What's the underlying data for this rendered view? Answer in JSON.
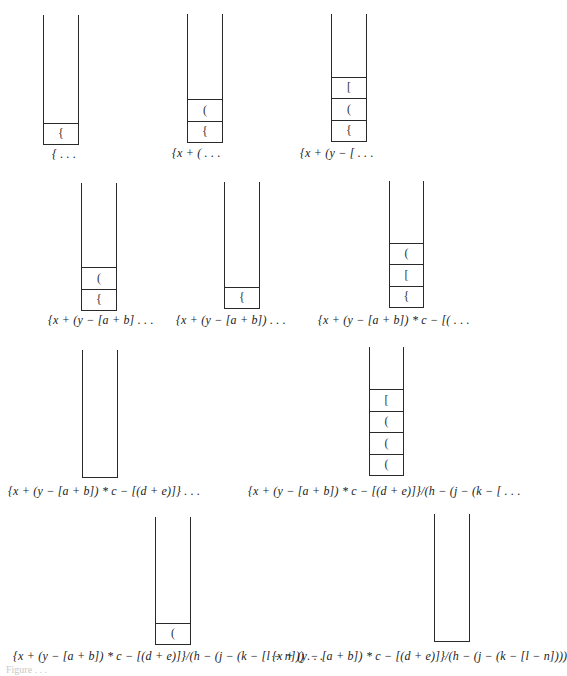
{
  "figure": {
    "stacks": [
      {
        "id": 1,
        "left": 43,
        "top": 15,
        "width": 36,
        "height": 130,
        "contents": [
          "{"
        ],
        "label": "{ . . .",
        "label_x": 52,
        "label_y": 147
      },
      {
        "id": 2,
        "left": 187,
        "top": 14,
        "width": 36,
        "height": 129,
        "contents": [
          "{",
          "("
        ],
        "label": "{x + ( . . .",
        "label_x": 172,
        "label_y": 146
      },
      {
        "id": 3,
        "left": 331,
        "top": 14,
        "width": 36,
        "height": 128,
        "contents": [
          "{",
          "(",
          "["
        ],
        "label": "{x + (y − [ . . .",
        "label_x": 300,
        "label_y": 146
      },
      {
        "id": 4,
        "left": 81,
        "top": 183,
        "width": 36,
        "height": 128,
        "contents": [
          "{",
          "("
        ],
        "label": "{x + (y − [a + b] . . .",
        "label_x": 48,
        "label_y": 313
      },
      {
        "id": 5,
        "left": 224,
        "top": 182,
        "width": 36,
        "height": 127,
        "contents": [
          "{"
        ],
        "label": "{x + (y − [a + b]) . . .",
        "label_x": 176,
        "label_y": 313
      },
      {
        "id": 6,
        "left": 389,
        "top": 181,
        "width": 35,
        "height": 127,
        "contents": [
          "{",
          "[",
          "("
        ],
        "label": "{x + (y − [a + b]) * c − [( . . .",
        "label_x": 318,
        "label_y": 313
      },
      {
        "id": 7,
        "left": 82,
        "top": 350,
        "width": 36,
        "height": 128,
        "contents": [],
        "label": "{x + (y − [a + b]) * c − [(d + e)]} . . .",
        "label_x": 8,
        "label_y": 484
      },
      {
        "id": 8,
        "left": 369,
        "top": 347,
        "width": 35,
        "height": 129,
        "contents": [
          "(",
          "(",
          "(",
          "["
        ],
        "label": "{x + (y − [a + b]) * c − [(d + e)]}/(h − (j − (k − [ . . .",
        "label_x": 248,
        "label_y": 484
      },
      {
        "id": 9,
        "left": 155,
        "top": 517,
        "width": 36,
        "height": 128,
        "contents": [
          "("
        ],
        "label": "{x + (y − [a + b]) * c − [(d + e)]}/(h − (j − (k − [l − n])) . . .",
        "label_x": 13,
        "label_y": 649
      },
      {
        "id": 10,
        "left": 434,
        "top": 514,
        "width": 36,
        "height": 128,
        "contents": [],
        "label": "{x + (y − [a + b]) * c − [(d + e)]}/(h − (j − (k − [l − n])))",
        "label_x": 272,
        "label_y": 649
      }
    ],
    "caption": "Figure . . ."
  }
}
